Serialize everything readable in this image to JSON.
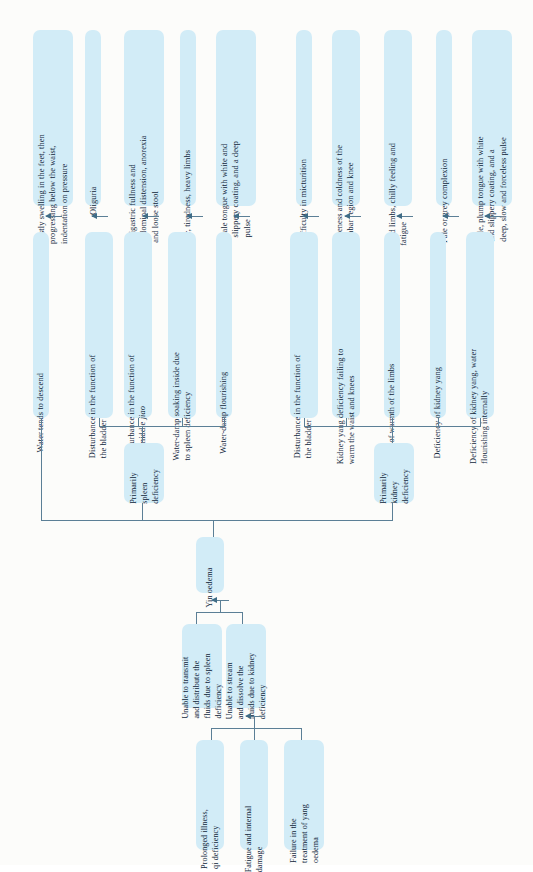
{
  "diagram": {
    "title": "Yin oedema",
    "type": "flowchart",
    "orientation": "rotated-90-ccw",
    "colors": {
      "node_fill": "#d2ecf7",
      "text": "#10263a",
      "connector": "#5b7f96",
      "page_background": "#fcfcfa"
    },
    "root": {
      "label": "Yin oedema"
    },
    "root_causes": [
      {
        "label": "Prolonged illness,\nqi deficiency"
      },
      {
        "label": "Fatigue and internal\ndamage"
      },
      {
        "label": "Failure in the\ntreatment of yang\noedema"
      }
    ],
    "pathogenesis": [
      {
        "label": "Unable to transmit\nand distribute the\nfluids due to spleen\ndeficiency"
      },
      {
        "label": "Unable to stream\nand dissolve the\nfluids due to kidney\ndeficiency"
      }
    ],
    "patterns": [
      {
        "label": "Primarily\nspleen\ndeficiency"
      },
      {
        "label": "Primarily\nkidney\ndeficiency"
      }
    ],
    "mechanisms": [
      {
        "label": "Water tends to descend",
        "pattern": "spleen",
        "italic": ""
      },
      {
        "label": "Disturbance in the function of\nthe bladder",
        "pattern": "spleen",
        "italic": ""
      },
      {
        "label": "Disturbance in the function of\nthe middle ",
        "italic": "jiao",
        "pattern": "spleen"
      },
      {
        "label": "Water-damp soaking inside due\nto spleen deficiency",
        "pattern": "spleen",
        "italic": ""
      },
      {
        "label": "Water-damp flourishing",
        "pattern": "spleen",
        "italic": ""
      },
      {
        "label": "Disturbance in the function of\nthe bladder",
        "pattern": "kidney",
        "italic": ""
      },
      {
        "label": "Kidney yang deficiency failing to\nwarm the waist and knees",
        "pattern": "kidney",
        "italic": ""
      },
      {
        "label": "Lack of warmth of the limbs",
        "pattern": "kidney",
        "italic": ""
      },
      {
        "label": "Deficiency of kidney yang",
        "pattern": "kidney",
        "italic": ""
      },
      {
        "label": "Deficiency of kidney yang, water\nflourishing internally",
        "pattern": "kidney",
        "italic": ""
      }
    ],
    "symptoms": [
      {
        "label": "Firstly swelling in the feet, then\nprogressing below the waist,\nindentation on pressure"
      },
      {
        "label": "Oliguria"
      },
      {
        "label": "Epigastric fullness and\nabdominal distension, anorexia\nand loose stool"
      },
      {
        "label": "Pallor, tiredness, heavy limbs"
      },
      {
        "label": "Pale tongue with white and\nslippery coating, and a deep\npulse"
      },
      {
        "label": "Difficulty in micturition"
      },
      {
        "label": "Soreness and coldness of the\nlumbar region and knee"
      },
      {
        "label": "Cold limbs, chilly feeling and\nfatigue"
      },
      {
        "label": "Pale or grey complexion"
      },
      {
        "label": "Pale, plump tongue with white\nand slippery coating, and a\ndeep, slow and forceless pulse"
      }
    ]
  }
}
